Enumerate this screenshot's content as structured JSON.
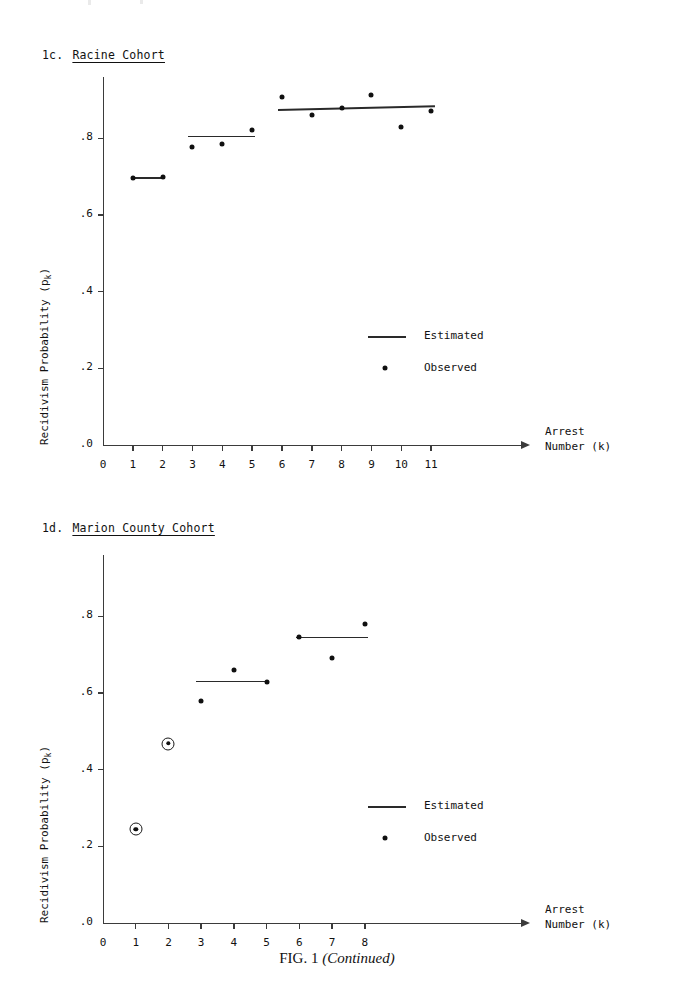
{
  "caption": {
    "figure_label": "FIG. 1",
    "continued": "(Continued)"
  },
  "panels": [
    {
      "id": "1c",
      "number": "1c.",
      "name": "Racine Cohort",
      "axis": {
        "ylabel": "Recidivism Probability (p",
        "ylabel_sub": "k",
        "ylabel_close": ")",
        "xlabel_line1": "Arrest",
        "xlabel_line2": "Number (k)",
        "yticks": [
          ".0",
          ".2",
          ".4",
          ".6",
          ".8"
        ],
        "ytick_values": [
          0.0,
          0.2,
          0.4,
          0.6,
          0.8
        ],
        "xticks": [
          "0",
          "1",
          "2",
          "3",
          "4",
          "5",
          "6",
          "7",
          "8",
          "9",
          "10",
          "11"
        ],
        "xtick_values": [
          0,
          1,
          2,
          3,
          4,
          5,
          6,
          7,
          8,
          9,
          10,
          11
        ]
      },
      "legend": [
        {
          "marker": "line",
          "label": "Estimated"
        },
        {
          "marker": "dot",
          "label": "Observed"
        }
      ]
    },
    {
      "id": "1d",
      "number": "1d.",
      "name": "Marion County Cohort",
      "axis": {
        "ylabel": "Recidivism Probability (p",
        "ylabel_sub": "k",
        "ylabel_close": ")",
        "xlabel_line1": "Arrest",
        "xlabel_line2": "Number (k)",
        "yticks": [
          ".0",
          ".2",
          ".4",
          ".6",
          ".8"
        ],
        "ytick_values": [
          0.0,
          0.2,
          0.4,
          0.6,
          0.8
        ],
        "xticks": [
          "0",
          "1",
          "2",
          "3",
          "4",
          "5",
          "6",
          "7",
          "8"
        ],
        "xtick_values": [
          0,
          1,
          2,
          3,
          4,
          5,
          6,
          7,
          8
        ]
      },
      "legend": [
        {
          "marker": "line",
          "label": "Estimated"
        },
        {
          "marker": "dot",
          "label": "Observed"
        }
      ]
    }
  ],
  "chart_data": [
    {
      "type": "scatter",
      "panel": "1c",
      "title": "1c. Racine Cohort",
      "xlabel": "Arrest Number (k)",
      "ylabel": "Recidivism Probability (p_k)",
      "xlim": [
        0,
        11.8
      ],
      "ylim": [
        0.0,
        0.96
      ],
      "grid": false,
      "legend_position": "inside-right",
      "series": [
        {
          "name": "Observed",
          "marker": "dot",
          "x": [
            1,
            2,
            3,
            4,
            5,
            6,
            7,
            8,
            9,
            10,
            11
          ],
          "values": [
            0.697,
            0.698,
            0.777,
            0.785,
            0.822,
            0.907,
            0.862,
            0.879,
            0.912,
            0.829,
            0.871
          ]
        },
        {
          "name": "Estimated",
          "marker": "line",
          "segments": [
            {
              "x0": 1.0,
              "x1": 2.0,
              "y0": 0.697,
              "y1": 0.697
            },
            {
              "x0": 2.85,
              "x1": 5.1,
              "y0": 0.805,
              "y1": 0.805
            },
            {
              "x0": 5.85,
              "x1": 11.1,
              "y0": 0.874,
              "y1": 0.884
            }
          ]
        }
      ]
    },
    {
      "type": "scatter",
      "panel": "1d",
      "title": "1d. Marion County Cohort",
      "xlabel": "Arrest Number (k)",
      "ylabel": "Recidivism Probability (p_k)",
      "xlim": [
        0,
        8.8
      ],
      "ylim": [
        0.0,
        0.96
      ],
      "grid": false,
      "legend_position": "inside-right",
      "series": [
        {
          "name": "Observed",
          "marker": "dot",
          "x": [
            1,
            2,
            3,
            4,
            5,
            6,
            7,
            8
          ],
          "values": [
            0.245,
            0.468,
            0.58,
            0.66,
            0.63,
            0.745,
            0.692,
            0.78
          ],
          "ringed_points": [
            1,
            2
          ]
        },
        {
          "name": "Estimated",
          "marker": "line",
          "segments": [
            {
              "x0": 2.85,
              "x1": 5.05,
              "y0": 0.63,
              "y1": 0.63
            },
            {
              "x0": 5.9,
              "x1": 8.1,
              "y0": 0.745,
              "y1": 0.745
            }
          ]
        }
      ]
    }
  ]
}
